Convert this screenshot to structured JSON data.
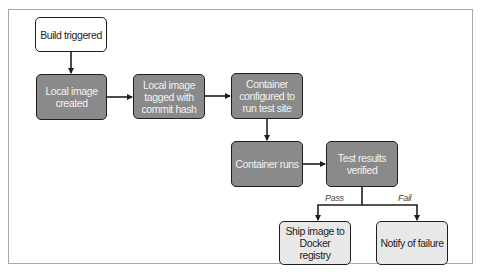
{
  "diagram": {
    "type": "flowchart",
    "nodes": [
      {
        "id": "build",
        "label": "Build triggered",
        "style": "start"
      },
      {
        "id": "local_image",
        "label": "Local image created",
        "style": "step"
      },
      {
        "id": "tagged",
        "label": "Local image tagged with commit hash",
        "style": "step"
      },
      {
        "id": "configured",
        "label": "Container configured to run test site",
        "style": "step"
      },
      {
        "id": "runs",
        "label": "Container runs",
        "style": "step"
      },
      {
        "id": "verified",
        "label": "Test results verified",
        "style": "step"
      },
      {
        "id": "ship",
        "label": "Ship image to Docker registry",
        "style": "end"
      },
      {
        "id": "notify",
        "label": "Notify of failure",
        "style": "end"
      }
    ],
    "edges": [
      {
        "from": "build",
        "to": "local_image"
      },
      {
        "from": "local_image",
        "to": "tagged"
      },
      {
        "from": "tagged",
        "to": "configured"
      },
      {
        "from": "configured",
        "to": "runs"
      },
      {
        "from": "runs",
        "to": "verified"
      },
      {
        "from": "verified",
        "to": "ship",
        "label": "Pass"
      },
      {
        "from": "verified",
        "to": "notify",
        "label": "Fail"
      }
    ],
    "branch_labels": {
      "pass": "Pass",
      "fail": "Fail"
    },
    "colors": {
      "step_fill": "#8a8a8a",
      "end_fill": "#e8e8e8",
      "start_fill": "#ffffff",
      "stroke": "#1e1e1e"
    }
  }
}
